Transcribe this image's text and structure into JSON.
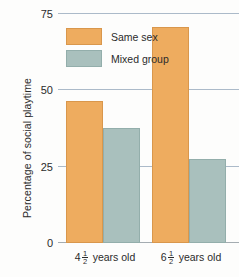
{
  "chart_data": {
    "type": "bar",
    "title": "",
    "xlabel": "",
    "ylabel": "Percentage of social playtime",
    "ylim": [
      0,
      75
    ],
    "yticks": [
      0,
      25,
      50,
      75
    ],
    "ytick_labels": [
      "0",
      "25",
      "50",
      "75"
    ],
    "grid": true,
    "legend_position": "upper-left-inside",
    "categories": [
      "4 1/2 years old",
      "6 1/2 years old"
    ],
    "category_labels": [
      {
        "whole": "4",
        "numerator": "1",
        "denominator": "2",
        "suffix": "years old"
      },
      {
        "whole": "6",
        "numerator": "1",
        "denominator": "2",
        "suffix": "years old"
      }
    ],
    "series": [
      {
        "name": "Same sex",
        "color": "#eeac5f",
        "values": [
          46,
          70
        ]
      },
      {
        "name": "Mixed group",
        "color": "#a9c0bd",
        "values": [
          37,
          27
        ]
      }
    ]
  },
  "legend": {
    "items": [
      {
        "label": "Same sex",
        "swatch": "same"
      },
      {
        "label": "Mixed group",
        "swatch": "mixed"
      }
    ]
  }
}
